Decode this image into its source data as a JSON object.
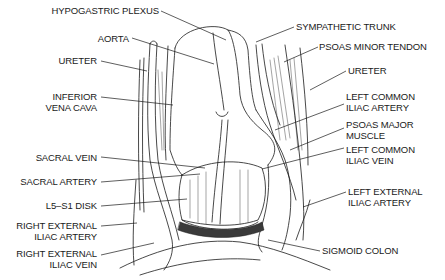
{
  "diagram": {
    "title": "",
    "labels_left": [
      {
        "id": "hypogastric-plexus",
        "text": "HYPOGASTRIC PLEXUS"
      },
      {
        "id": "aorta",
        "text": "AORTA"
      },
      {
        "id": "ureter-right",
        "text": "URETER"
      },
      {
        "id": "inferior-vena-cava",
        "text": "INFERIOR\nVENA CAVA"
      },
      {
        "id": "sacral-vein",
        "text": "SACRAL VEIN"
      },
      {
        "id": "sacral-artery",
        "text": "SACRAL ARTERY"
      },
      {
        "id": "l5-s1-disk",
        "text": "L5–S1 DISK"
      },
      {
        "id": "right-external-iliac-artery",
        "text": "RIGHT EXTERNAL\nILIAC ARTERY"
      },
      {
        "id": "right-external-iliac-vein",
        "text": "RIGHT EXTERNAL\nILIAC VEIN"
      }
    ],
    "labels_right": [
      {
        "id": "sympathetic-trunk",
        "text": "SYMPATHETIC TRUNK"
      },
      {
        "id": "psoas-minor-tendon",
        "text": "PSOAS MINOR TENDON"
      },
      {
        "id": "ureter-left",
        "text": "URETER"
      },
      {
        "id": "left-common-iliac-artery",
        "text": "LEFT COMMON\nILIAC ARTERY"
      },
      {
        "id": "psoas-major-muscle",
        "text": "PSOAS MAJOR\nMUSCLE"
      },
      {
        "id": "left-common-iliac-vein",
        "text": "LEFT COMMON\nILIAC VEIN"
      },
      {
        "id": "left-external-iliac-artery",
        "text": "LEFT EXTERNAL\nILIAC ARTERY"
      },
      {
        "id": "sigmoid-colon",
        "text": "SIGMOID COLON"
      }
    ],
    "colors": {
      "ink": "#1a1a1a",
      "background": "#ffffff"
    }
  }
}
